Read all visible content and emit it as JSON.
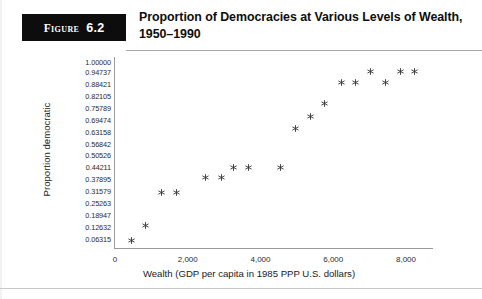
{
  "header": {
    "badge_word": "Figure",
    "badge_number": "6.2",
    "title": "Proportion of Democracies at Various Levels of Wealth, 1950–1990"
  },
  "chart_data": {
    "type": "scatter",
    "title": "Proportion of Democracies at Various Levels of Wealth, 1950–1990",
    "xlabel": "Wealth (GDP per capita in 1985 PPP U.S. dollars)",
    "ylabel": "Proportion democratic",
    "xlim": [
      0,
      8700
    ],
    "ylim": [
      0,
      1.0
    ],
    "grid": false,
    "legend": null,
    "marker": "asterisk",
    "marker_color": "#3a3a3a",
    "xticks": [
      "0",
      "2,000",
      "4,000",
      "6,000",
      "8,000"
    ],
    "xtick_values": [
      0,
      2000,
      4000,
      6000,
      8000
    ],
    "yticks": [
      "1.00000",
      "0.94737",
      "0.88421",
      "0.82105",
      "0.75789",
      "0.69474",
      "0.63158",
      "0.56842",
      "0.50526",
      "0.44211",
      "0.37895",
      "0.31579",
      "0.25263",
      "0.18947",
      "0.12632",
      "0.06315"
    ],
    "ytick_values": [
      1.0,
      0.94737,
      0.88421,
      0.82105,
      0.75789,
      0.69474,
      0.63158,
      0.56842,
      0.50526,
      0.44211,
      0.37895,
      0.31579,
      0.25263,
      0.18947,
      0.12632,
      0.06315
    ],
    "points": [
      {
        "x": 440,
        "y": 0.063
      },
      {
        "x": 850,
        "y": 0.139
      },
      {
        "x": 1290,
        "y": 0.316
      },
      {
        "x": 1680,
        "y": 0.316
      },
      {
        "x": 2500,
        "y": 0.392
      },
      {
        "x": 2940,
        "y": 0.392
      },
      {
        "x": 3270,
        "y": 0.447
      },
      {
        "x": 3680,
        "y": 0.447
      },
      {
        "x": 4560,
        "y": 0.447
      },
      {
        "x": 4970,
        "y": 0.655
      },
      {
        "x": 5380,
        "y": 0.718
      },
      {
        "x": 5770,
        "y": 0.786
      },
      {
        "x": 6240,
        "y": 0.897
      },
      {
        "x": 6620,
        "y": 0.897
      },
      {
        "x": 7030,
        "y": 0.955
      },
      {
        "x": 7450,
        "y": 0.897
      },
      {
        "x": 7860,
        "y": 0.955
      },
      {
        "x": 8240,
        "y": 0.955
      }
    ]
  }
}
